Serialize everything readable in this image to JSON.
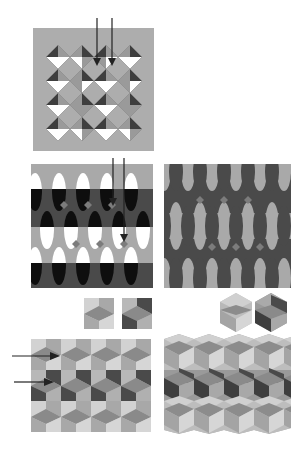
{
  "figure": {
    "colors": {
      "light_gray": "#b4b4b4",
      "mid_gray": "#9a9a9a",
      "dark_gray": "#5a5a5a",
      "darker": "#3c3c3c",
      "black": "#111111",
      "white": "#ffffff",
      "pale": "#d4d4d4",
      "diamond": "#8a8a8a"
    },
    "panels": [
      {
        "id": "pinwheel-square-pattern",
        "label": "",
        "position": "top"
      },
      {
        "id": "banded-ellipse-pattern",
        "label": "",
        "position": "middle-left"
      },
      {
        "id": "wavy-ellipse-pattern",
        "label": "",
        "position": "middle-right"
      },
      {
        "id": "square-cube-tiles",
        "label": "",
        "position": "small-left"
      },
      {
        "id": "hexagon-cube-tiles",
        "label": "",
        "position": "small-right"
      },
      {
        "id": "cube-tessellation-rect",
        "label": "",
        "position": "bottom-left"
      },
      {
        "id": "cube-tessellation-zigzag",
        "label": "",
        "position": "bottom-right"
      }
    ],
    "arrows": [
      {
        "panel": "top",
        "count": 2,
        "direction": "down"
      },
      {
        "panel": "middle-left",
        "count": 2,
        "direction": "down"
      },
      {
        "panel": "bottom-left",
        "count": 2,
        "direction": "right"
      }
    ]
  }
}
